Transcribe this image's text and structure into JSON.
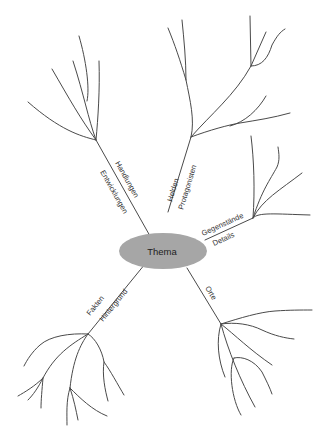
{
  "diagram": {
    "type": "mind-map",
    "center": {
      "label": "Thema",
      "fill": "#a6a6a6"
    },
    "line_color": "#4a4a4a",
    "text_color": "#333333",
    "background": "#ffffff",
    "branches": [
      {
        "id": "handlungen",
        "direction": "upper-left",
        "labels": [
          "Handlungen",
          "Entwicklungen"
        ]
      },
      {
        "id": "helden",
        "direction": "up",
        "labels": [
          "Helden",
          "Protagonisten"
        ]
      },
      {
        "id": "gegenstaende",
        "direction": "right",
        "labels": [
          "Gegenstände",
          "Details"
        ]
      },
      {
        "id": "orte",
        "direction": "lower-right",
        "labels": [
          "Orte"
        ]
      },
      {
        "id": "fakten",
        "direction": "lower-left",
        "labels": [
          "Fakten",
          "Hintergrund"
        ]
      }
    ]
  }
}
